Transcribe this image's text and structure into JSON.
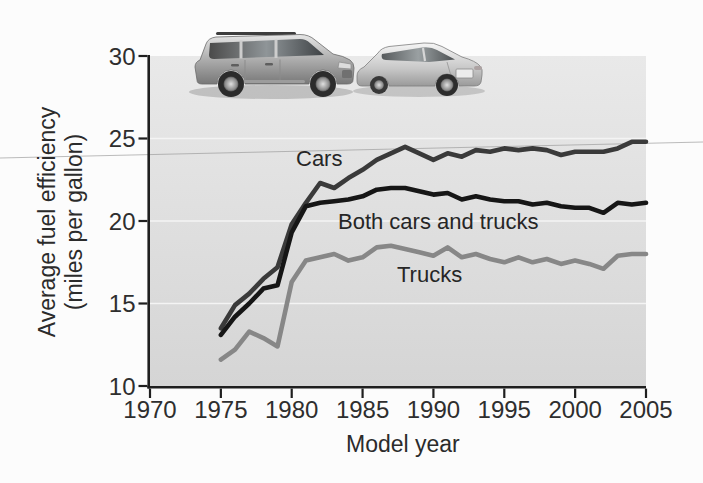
{
  "figure": {
    "x_axis_title": "Model year",
    "y_axis_title_line1": "Average fuel efficiency",
    "y_axis_title_line2": "(miles per gallon)",
    "series_labels": {
      "cars": "Cars",
      "both": "Both cars and trucks",
      "trucks": "Trucks"
    }
  },
  "icons": {
    "suv": "suv-photo-illustration",
    "sedan": "sedan-photo-illustration"
  },
  "colors": {
    "cars_line": "#3a3a3a",
    "both_line": "#161616",
    "trucks_line": "#878787",
    "axis": "#1f1f1f",
    "tick_text": "#2e2e2e",
    "plot_background_top": "#e9e9e9",
    "plot_background_bottom": "#d5d5d5",
    "white_gridline": "#f4f4f4",
    "scan_artifact_line": "#999999"
  },
  "chart_data": {
    "type": "line",
    "title": "",
    "xlabel": "Model year",
    "ylabel": "Average fuel efficiency (miles per gallon)",
    "xlim": [
      1970,
      2005
    ],
    "ylim": [
      10,
      30
    ],
    "x_ticks": [
      1970,
      1975,
      1980,
      1985,
      1990,
      1995,
      2000,
      2005
    ],
    "y_ticks": [
      10,
      15,
      20,
      25,
      30
    ],
    "grid": "white horizontal gridlines",
    "white_gridlines_at": [
      15,
      20,
      25
    ],
    "legend_position": "inline labels next to lines",
    "x": [
      1975,
      1976,
      1977,
      1978,
      1979,
      1980,
      1981,
      1982,
      1983,
      1984,
      1985,
      1986,
      1987,
      1988,
      1989,
      1990,
      1991,
      1992,
      1993,
      1994,
      1995,
      1996,
      1997,
      1998,
      1999,
      2000,
      2001,
      2002,
      2003,
      2004,
      2005
    ],
    "series": [
      {
        "name": "Cars",
        "color": "#3a3a3a",
        "width": 4.6,
        "values": [
          13.5,
          14.9,
          15.6,
          16.5,
          17.2,
          19.8,
          21.1,
          22.3,
          22.0,
          22.6,
          23.1,
          23.7,
          24.1,
          24.5,
          24.1,
          23.7,
          24.1,
          23.9,
          24.3,
          24.2,
          24.4,
          24.3,
          24.4,
          24.3,
          24.0,
          24.2,
          24.2,
          24.2,
          24.4,
          24.8,
          24.8
        ]
      },
      {
        "name": "Both cars and trucks",
        "color": "#161616",
        "width": 4.6,
        "values": [
          13.1,
          14.2,
          15.0,
          15.9,
          16.1,
          19.3,
          20.9,
          21.1,
          21.2,
          21.3,
          21.5,
          21.9,
          22.0,
          22.0,
          21.8,
          21.6,
          21.7,
          21.3,
          21.5,
          21.3,
          21.2,
          21.2,
          21.0,
          21.1,
          20.9,
          20.8,
          20.8,
          20.5,
          21.1,
          21.0,
          21.1
        ]
      },
      {
        "name": "Trucks",
        "color": "#878787",
        "width": 4.6,
        "values": [
          11.6,
          12.2,
          13.3,
          12.9,
          12.4,
          16.3,
          17.6,
          17.8,
          18.0,
          17.6,
          17.8,
          18.4,
          18.5,
          18.3,
          18.1,
          17.9,
          18.4,
          17.8,
          18.0,
          17.7,
          17.5,
          17.8,
          17.5,
          17.7,
          17.4,
          17.6,
          17.4,
          17.1,
          17.9,
          18.0,
          18.0
        ]
      }
    ]
  }
}
